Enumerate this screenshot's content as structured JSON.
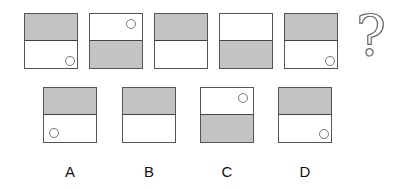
{
  "puzzle": {
    "question_mark": "?",
    "sequence": [
      {
        "top_shaded": true,
        "circle": "bottom-right"
      },
      {
        "top_shaded": false,
        "circle": "top-right"
      },
      {
        "top_shaded": true,
        "circle": "none"
      },
      {
        "top_shaded": false,
        "circle": "none"
      },
      {
        "top_shaded": true,
        "circle": "bottom-right"
      }
    ],
    "options": [
      {
        "label": "A",
        "top_shaded": true,
        "circle": "bottom-left"
      },
      {
        "label": "B",
        "top_shaded": true,
        "circle": "none"
      },
      {
        "label": "C",
        "top_shaded": false,
        "circle": "top-right"
      },
      {
        "label": "D",
        "top_shaded": true,
        "circle": "bottom-right"
      }
    ]
  },
  "colors": {
    "shade": "#c3c3c3",
    "border": "#555555"
  }
}
